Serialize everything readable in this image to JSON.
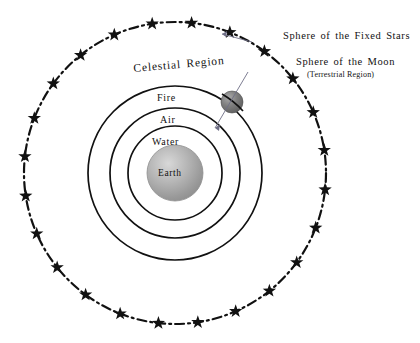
{
  "diagram": {
    "background_color": "#ffffff",
    "ink_color": "#111111"
  },
  "labels": {
    "fixed_stars": "Sphere of the Fixed Stars",
    "moon_sphere": "Sphere of the Moon",
    "terrestrial_region": "(Terrestrial Region)",
    "celestial_region": "Celestial Region",
    "fire": "Fire",
    "air": "Air",
    "water": "Water",
    "earth": "Earth"
  },
  "chart_data": {
    "type": "diagram",
    "center": {
      "x": 175,
      "y": 173
    },
    "spheres": [
      {
        "name": "sphere-of-the-fixed-stars",
        "label": "Sphere of the Fixed Stars",
        "radius": 151,
        "stroke": "#111111",
        "style": "dash-dot",
        "stroke_width": 2.2,
        "has_stars": true
      },
      {
        "name": "sphere-of-the-moon",
        "label": "Sphere of the Moon",
        "radius": 87,
        "stroke": "#111111",
        "style": "solid",
        "stroke_width": 1.6,
        "region_label": "Fire"
      },
      {
        "name": "sphere-of-air",
        "label": "Air",
        "radius": 65,
        "stroke": "#111111",
        "style": "solid",
        "stroke_width": 1.6
      },
      {
        "name": "sphere-of-water",
        "label": "Water",
        "radius": 47,
        "stroke": "#111111",
        "style": "solid",
        "stroke_width": 1.6
      },
      {
        "name": "sphere-of-earth",
        "label": "Earth",
        "radius": 28,
        "stroke": "#555555",
        "style": "filled-gradient",
        "stroke_width": 1
      }
    ],
    "moon": {
      "cx": 232,
      "cy": 102,
      "radius": 11,
      "fill": "gray-gradient"
    },
    "star_count": 24,
    "star_radius": 151,
    "star_size": 7,
    "callouts": [
      {
        "text": "Sphere of the Fixed Stars",
        "anchor_x": 257,
        "anchor_y": 43,
        "target_x": 262,
        "target_y": 45
      },
      {
        "text": "Sphere of the Moon",
        "anchor_x": 250,
        "anchor_y": 127,
        "target_x": 258,
        "target_y": 130
      }
    ]
  }
}
